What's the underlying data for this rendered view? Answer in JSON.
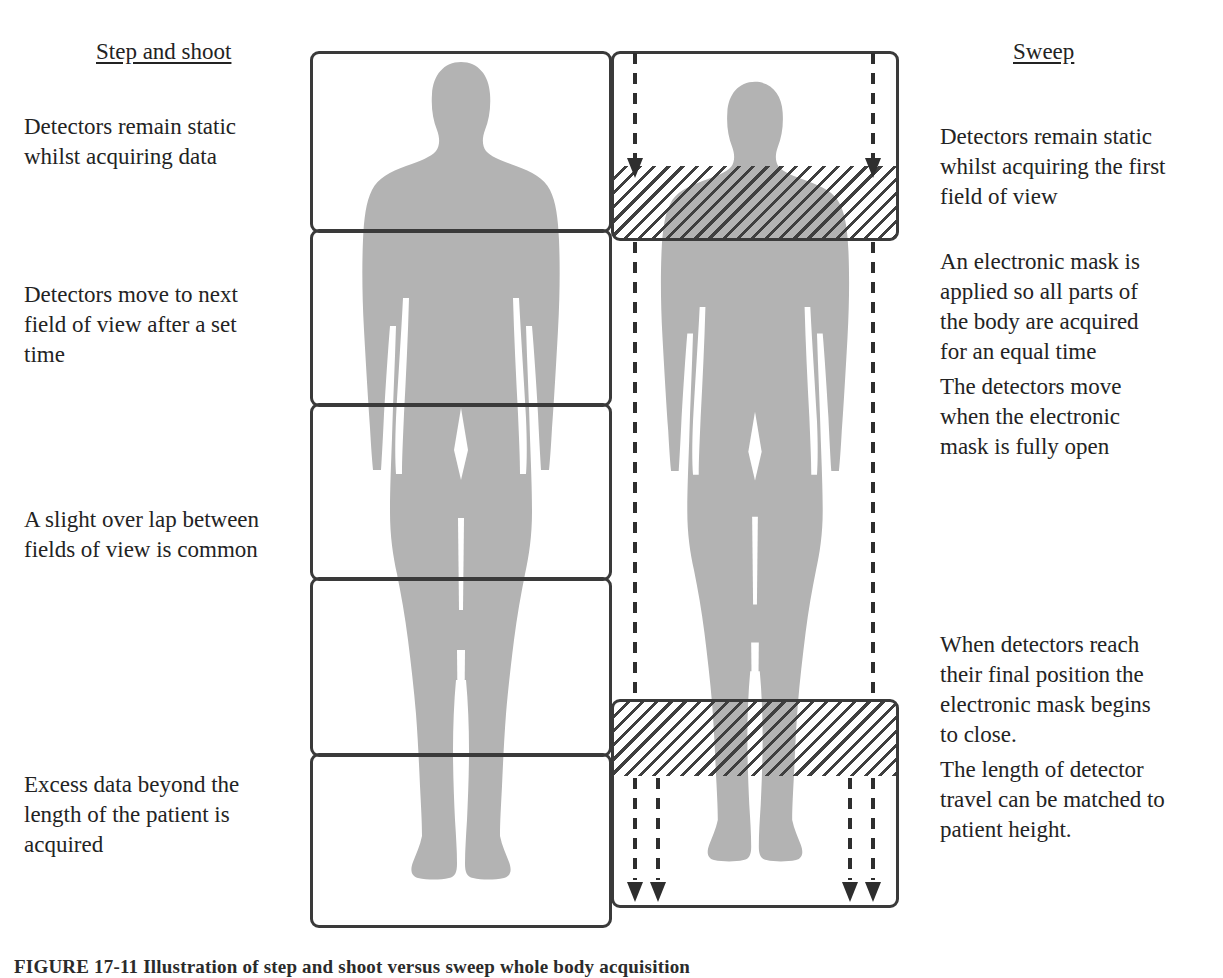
{
  "figure": {
    "caption": "FIGURE 17-11   Illustration of step and shoot versus sweep whole body acquisition",
    "background_color": "#ffffff",
    "body_silhouette_color": "#b3b3b3",
    "outline_color": "#3a3a3a",
    "hatch_color": "#3f3f3f"
  },
  "left_column": {
    "title": "Step and shoot",
    "notes": [
      "Detectors remain static whilst acquiring data",
      "Detectors move to next field of view after a set time",
      "A slight over lap between fields of view is common",
      "Excess data beyond the length of the patient is acquired"
    ],
    "field_of_view_count": 5
  },
  "right_column": {
    "title": "Sweep",
    "notes": [
      "Detectors remain static whilst acquiring the  first field of view",
      "An electronic mask is applied so all parts of the body are acquired for an equal time",
      "The detectors move when the  electronic mask is fully open",
      "When detectors reach their final position the electronic mask begins to close.",
      "The length of detector travel can be matched to patient height."
    ],
    "masked_region_label": "electronic-mask-hatched-region",
    "travel_arrow_count": 4
  }
}
